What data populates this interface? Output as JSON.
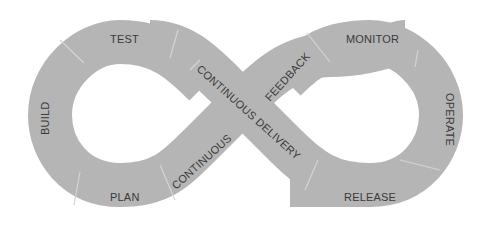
{
  "diagram": {
    "type": "devops-infinity-loop",
    "band_color": "#b5b5b5",
    "text_color": "#3a3a3a",
    "divider_color": "#d4d4d4",
    "stages": {
      "test": "TEST",
      "build": "BUILD",
      "plan": "PLAN",
      "continuous": "CONTINUOUS",
      "continuous_delivery": "CONTINUOUS DELIVERY",
      "feedback": "FEEDBACK",
      "monitor": "MONITOR",
      "operate": "OPERATE",
      "release": "RELEASE"
    }
  }
}
